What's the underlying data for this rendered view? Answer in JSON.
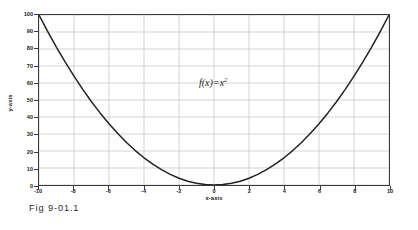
{
  "figure": {
    "caption": "Fig 9-01.1"
  },
  "chart_data": {
    "type": "line",
    "title": "",
    "xlabel": "x-axis",
    "ylabel": "y-axis",
    "annotation": "f(x)=x",
    "annotation_exponent": "2",
    "xlim": [
      -10,
      10
    ],
    "ylim": [
      0,
      100
    ],
    "grid": true,
    "legend": "none",
    "xticks": [
      "-10",
      "-8",
      "-6",
      "-4",
      "-2",
      "0",
      "2",
      "4",
      "6",
      "8",
      "10"
    ],
    "xtick_values": [
      -10,
      -8,
      -6,
      -4,
      -2,
      0,
      2,
      4,
      6,
      8,
      10
    ],
    "yticks": [
      "0",
      "10",
      "20",
      "30",
      "40",
      "50",
      "60",
      "70",
      "80",
      "90",
      "100"
    ],
    "ytick_values": [
      0,
      10,
      20,
      30,
      40,
      50,
      60,
      70,
      80,
      90,
      100
    ],
    "series": [
      {
        "name": "f(x)=x^2",
        "color": "#222222",
        "x": [
          -10,
          -9.5,
          -9,
          -8.5,
          -8,
          -7.5,
          -7,
          -6.5,
          -6,
          -5.5,
          -5,
          -4.5,
          -4,
          -3.5,
          -3,
          -2.5,
          -2,
          -1.5,
          -1,
          -0.5,
          0,
          0.5,
          1,
          1.5,
          2,
          2.5,
          3,
          3.5,
          4,
          4.5,
          5,
          5.5,
          6,
          6.5,
          7,
          7.5,
          8,
          8.5,
          9,
          9.5,
          10
        ],
        "values": [
          100,
          90.25,
          81,
          72.25,
          64,
          56.25,
          49,
          42.25,
          36,
          30.25,
          25,
          20.25,
          16,
          12.25,
          9,
          6.25,
          4,
          2.25,
          1,
          0.25,
          0,
          0.25,
          1,
          2.25,
          4,
          6.25,
          9,
          12.25,
          16,
          20.25,
          25,
          30.25,
          36,
          42.25,
          49,
          56.25,
          64,
          72.25,
          81,
          90.25,
          100
        ]
      }
    ],
    "colors": {
      "curve": "#222222",
      "grid": "#c8c8c8",
      "frame": "#3a3a3a",
      "background": "#ffffff",
      "text": "#1a1a1a"
    }
  }
}
